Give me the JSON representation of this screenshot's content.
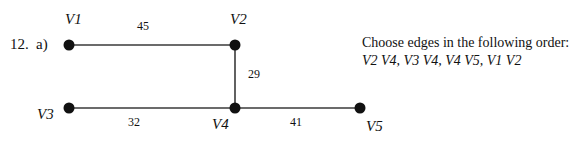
{
  "question": {
    "number": "12.",
    "part": "a)"
  },
  "graph": {
    "vertices": [
      {
        "id": "V1",
        "label": "V1",
        "x": 69,
        "y": 45
      },
      {
        "id": "V2",
        "label": "V2",
        "x": 235,
        "y": 45
      },
      {
        "id": "V3",
        "label": "V3",
        "x": 69,
        "y": 108
      },
      {
        "id": "V4",
        "label": "V4",
        "x": 235,
        "y": 108
      },
      {
        "id": "V5",
        "label": "V5",
        "x": 360,
        "y": 108
      }
    ],
    "edges": [
      {
        "from": "V1",
        "to": "V2",
        "weight": "45"
      },
      {
        "from": "V2",
        "to": "V4",
        "weight": "29"
      },
      {
        "from": "V3",
        "to": "V4",
        "weight": "32"
      },
      {
        "from": "V4",
        "to": "V5",
        "weight": "41"
      }
    ]
  },
  "instructions": {
    "line1": "Choose edges in the following order:",
    "line2": "V2 V4, V3 V4, V4 V5, V1 V2"
  },
  "colors": {
    "line": "#3a3a3a",
    "node": "#111111",
    "text": "#111111"
  }
}
